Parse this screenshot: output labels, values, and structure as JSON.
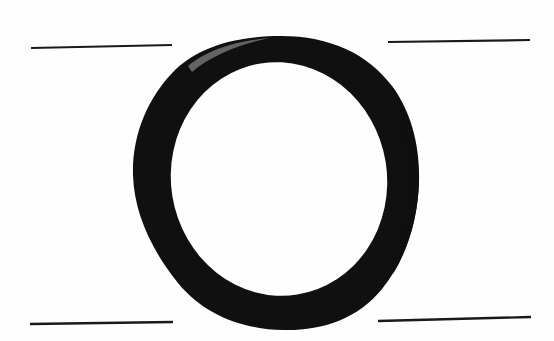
{
  "document": {
    "kind": "letterform-specimen",
    "title": "Letter O specimen",
    "background_color": "#fefefe",
    "ink_color": "#111111",
    "width": 554,
    "height": 341,
    "caption": "O"
  },
  "glyph": {
    "name": "letter-o-glyph",
    "character": "O",
    "description": "Bold oblique-stress letter O with thick left and right strokes and thin joins at upper-left and lower-right",
    "fill_color": "#101010",
    "outer": {
      "center_x": 276,
      "center_y": 183,
      "radius_x": 143,
      "radius_y": 147,
      "left": 133,
      "right": 419,
      "top": 36,
      "bottom": 330
    },
    "counter": {
      "center_x": 279,
      "center_y": 179,
      "radius_x": 108,
      "radius_y": 117,
      "rotation_deg": -9,
      "left": 171,
      "right": 387,
      "top": 62,
      "bottom": 296,
      "fill_color": "#fefefe"
    },
    "stroke_weights": {
      "left_max": 48,
      "right_max": 44,
      "top_thin": 26,
      "bottom_thin": 30
    }
  },
  "rules": [
    {
      "name": "rule-top-left",
      "position": "top-left",
      "x1": 31,
      "y1": 48,
      "x2": 172,
      "y2": 45,
      "thickness": 2.2,
      "color": "#1a1a1a"
    },
    {
      "name": "rule-top-right",
      "position": "top-right",
      "x1": 388,
      "y1": 42,
      "x2": 530,
      "y2": 40,
      "thickness": 2.2,
      "color": "#1a1a1a"
    },
    {
      "name": "rule-bottom-left",
      "position": "bottom-left",
      "x1": 30,
      "y1": 324,
      "x2": 173,
      "y2": 322,
      "thickness": 2.4,
      "color": "#1a1a1a"
    },
    {
      "name": "rule-bottom-right",
      "position": "bottom-right",
      "x1": 378,
      "y1": 321,
      "x2": 531,
      "y2": 317,
      "thickness": 2.4,
      "color": "#1a1a1a"
    }
  ]
}
